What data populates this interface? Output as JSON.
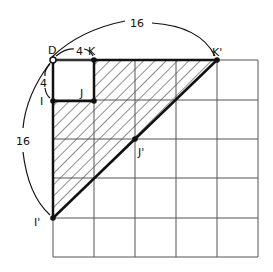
{
  "diagram": {
    "type": "geometry-grid-dilation",
    "grid": {
      "rows": 5,
      "cols": 5
    },
    "points": {
      "D": "D",
      "K": "K",
      "I": "I",
      "J": "J",
      "K_prime": "K'",
      "J_prime": "J'",
      "I_prime": "I'"
    },
    "measurements": {
      "DK": "4",
      "DI": "4",
      "DK_prime": "16",
      "DI_prime": "16"
    },
    "shaded_region": "triangle D K' I' minus square D K J I (hatched)",
    "colors": {
      "ink": "#111111",
      "grid": "#555555",
      "background": "#ffffff"
    }
  }
}
